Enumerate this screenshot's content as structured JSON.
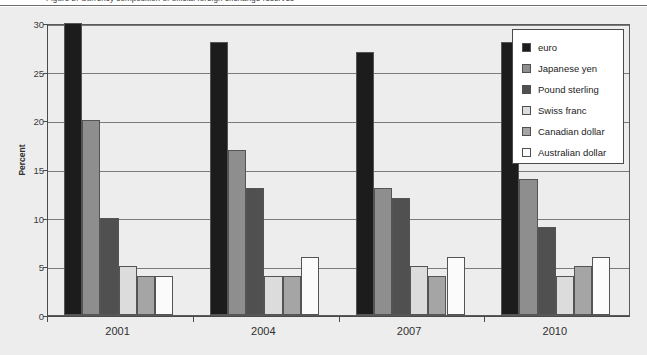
{
  "caption": {
    "text": "Figure 2. Currency composition of official foreign exchange reserves",
    "visible": "clipped"
  },
  "chart_data": {
    "type": "bar",
    "title": "",
    "subtitle": "",
    "xlabel": "",
    "ylabel": "Percent",
    "categories": [
      "2001",
      "2004",
      "2007",
      "2010"
    ],
    "ylim": [
      0,
      30
    ],
    "yticks": [
      0,
      5,
      10,
      15,
      20,
      25,
      30
    ],
    "ytick_labels": [
      "0",
      "5",
      "10",
      "15",
      "20",
      "25",
      "30"
    ],
    "grid": true,
    "grid_axis": "y",
    "legend_position": "upper-right",
    "legend_boxed": true,
    "series": [
      {
        "name": "euro",
        "color": "#1c1c1c",
        "values": [
          30,
          28,
          27,
          28
        ]
      },
      {
        "name": "Japanese yen",
        "color": "#8e8e8e",
        "values": [
          20,
          17,
          13,
          14
        ]
      },
      {
        "name": "Pound sterling",
        "color": "#505050",
        "values": [
          10,
          13,
          12,
          9
        ]
      },
      {
        "name": "Swiss franc",
        "color": "#dcdcdc",
        "values": [
          5,
          4,
          5,
          4
        ]
      },
      {
        "name": "Canadian dollar",
        "color": "#a5a5a5",
        "values": [
          4,
          4,
          4,
          5
        ]
      },
      {
        "name": "Australian dollar",
        "color": "#fbfbfb",
        "values": [
          4,
          6,
          6,
          6
        ]
      }
    ]
  },
  "colors": {
    "figure_background": "#ededed",
    "plot_background": "#ededed",
    "axis": "#4a4a4a",
    "gridline": "#7a7a7a",
    "bar_outline": "#545454",
    "legend_background": "#ffffff",
    "legend_border": "#4a4a4a",
    "text": "#2f2f2f"
  }
}
